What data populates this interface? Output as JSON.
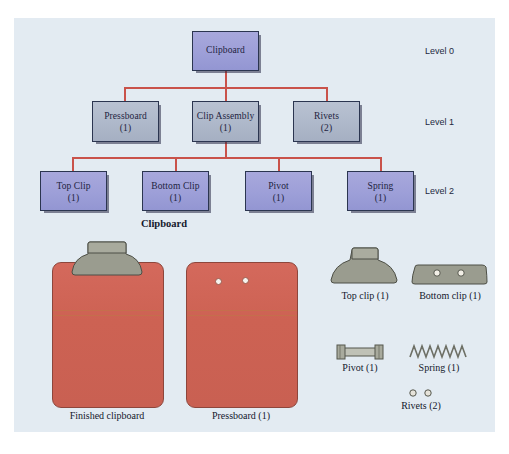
{
  "figure": {
    "title": "Clipboard",
    "type": "bill-of-materials-tree"
  },
  "tree": {
    "levels": [
      {
        "label": "Level 0"
      },
      {
        "label": "Level 1"
      },
      {
        "label": "Level 2"
      }
    ],
    "nodes": [
      {
        "id": "clipboard",
        "name": "Clipboard",
        "qty": "",
        "level": 0,
        "style": "lavender"
      },
      {
        "id": "pressboard",
        "name": "Pressboard",
        "qty": "(1)",
        "level": 1,
        "style": "greyblue"
      },
      {
        "id": "clip-assembly",
        "name": "Clip Assembly",
        "qty": "(1)",
        "level": 1,
        "style": "greyblue"
      },
      {
        "id": "rivets",
        "name": "Rivets",
        "qty": "(2)",
        "level": 1,
        "style": "greyblue"
      },
      {
        "id": "top-clip",
        "name": "Top Clip",
        "qty": "(1)",
        "level": 2,
        "style": "lavender"
      },
      {
        "id": "bottom-clip",
        "name": "Bottom Clip",
        "qty": "(1)",
        "level": 2,
        "style": "lavender"
      },
      {
        "id": "pivot",
        "name": "Pivot",
        "qty": "(1)",
        "level": 2,
        "style": "lavender"
      },
      {
        "id": "spring",
        "name": "Spring",
        "qty": "(1)",
        "level": 2,
        "style": "lavender"
      }
    ]
  },
  "illustration": {
    "heading": "Clipboard",
    "parts": [
      {
        "id": "finished-clipboard",
        "caption": "Finished clipboard"
      },
      {
        "id": "pressboard",
        "caption": "Pressboard (1)"
      },
      {
        "id": "top-clip",
        "caption": "Top clip (1)"
      },
      {
        "id": "bottom-clip",
        "caption": "Bottom clip (1)"
      },
      {
        "id": "pivot",
        "caption": "Pivot (1)"
      },
      {
        "id": "spring",
        "caption": "Spring (1)"
      },
      {
        "id": "rivets",
        "caption": "Rivets (2)"
      }
    ]
  },
  "colors": {
    "panel_background": "#e3ebf2",
    "node_lavender": "#9d9fd8",
    "node_greyblue": "#aeb8ca",
    "connector": "#c9524a",
    "board_red": "#cd6253",
    "metal_grey": "#989a8d",
    "text": "#1d2340"
  }
}
